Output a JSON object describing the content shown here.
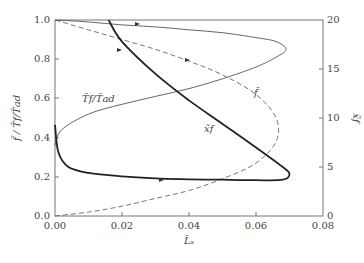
{
  "chart_data": {
    "type": "line",
    "title": "",
    "xlabel": "L̃ₛ",
    "ylabel_left": "f̃ / T̃f/T̃ad",
    "ylabel_right": "x̃f",
    "xlim": [
      0.0,
      0.08
    ],
    "ylim_left": [
      0.0,
      1.0
    ],
    "ylim_right": [
      0,
      20
    ],
    "x_ticks": [
      "0.00",
      "0.02",
      "0.04",
      "0.06",
      "0.08"
    ],
    "y_left_ticks": [
      "0.0",
      "0.2",
      "0.4",
      "0.6",
      "0.8",
      "1.0"
    ],
    "y_right_ticks": [
      "0",
      "5",
      "10",
      "15",
      "20"
    ],
    "grid": false,
    "legend": "inline labels",
    "series": [
      {
        "name": "T̃f/T̃ad",
        "axis": "left",
        "style": "thin solid",
        "x": [
          0.0,
          0.002,
          0.01,
          0.02,
          0.03,
          0.04,
          0.05,
          0.06,
          0.066,
          0.069,
          0.066,
          0.06,
          0.05,
          0.04,
          0.03,
          0.02,
          0.01,
          0.0
        ],
        "y": [
          0.36,
          0.44,
          0.52,
          0.57,
          0.61,
          0.65,
          0.7,
          0.76,
          0.81,
          0.85,
          0.89,
          0.91,
          0.935,
          0.95,
          0.965,
          0.975,
          0.99,
          1.0
        ]
      },
      {
        "name": "f̃",
        "axis": "left",
        "style": "dashed",
        "x": [
          0.0,
          0.01,
          0.02,
          0.03,
          0.04,
          0.05,
          0.06,
          0.066,
          0.066,
          0.06,
          0.05,
          0.04,
          0.03,
          0.02,
          0.01,
          0.0
        ],
        "y": [
          0.0,
          0.02,
          0.05,
          0.09,
          0.13,
          0.19,
          0.27,
          0.38,
          0.5,
          0.62,
          0.72,
          0.79,
          0.85,
          0.9,
          0.95,
          1.0
        ]
      },
      {
        "name": "x̃f",
        "axis": "right",
        "style": "thick solid",
        "x": [
          0.016,
          0.02,
          0.03,
          0.04,
          0.05,
          0.06,
          0.068,
          0.07,
          0.068,
          0.06,
          0.05,
          0.04,
          0.03,
          0.02,
          0.01,
          0.004,
          0.001,
          0.0
        ],
        "y": [
          20,
          17.8,
          14.5,
          11.8,
          9.4,
          7.0,
          5.0,
          4.3,
          3.7,
          3.65,
          3.7,
          3.75,
          3.85,
          4.05,
          4.4,
          5.0,
          6.5,
          9.3
        ]
      }
    ],
    "annotations": [
      {
        "text": "T̃f/T̃ad",
        "x": 0.007,
        "y": 0.6
      },
      {
        "text": "x̃f",
        "x": 0.044,
        "y": 0.45
      },
      {
        "text": "f̃",
        "x": 0.06,
        "y": 0.66
      }
    ]
  }
}
